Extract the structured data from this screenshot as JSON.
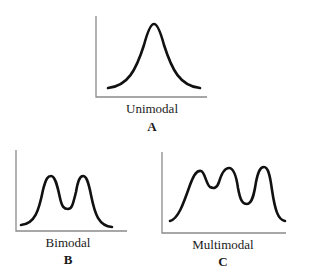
{
  "panels": [
    {
      "id": "A",
      "label": "Unimodal",
      "letter": "A"
    },
    {
      "id": "B",
      "label": "Bimodal",
      "letter": "B"
    },
    {
      "id": "C",
      "label": "Multimodal",
      "letter": "C"
    }
  ],
  "colors": {
    "axis": "#8a8a8a",
    "curve": "#111111",
    "text": "#1a1a1a"
  }
}
